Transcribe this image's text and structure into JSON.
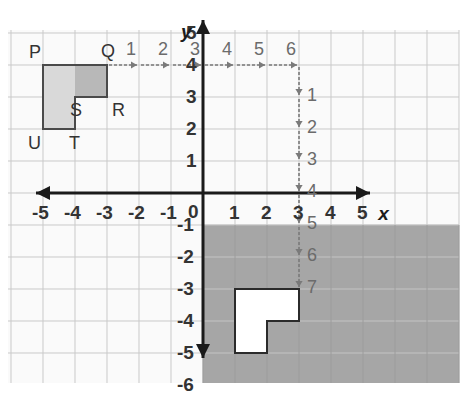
{
  "figure": {
    "type": "coordinate-grid",
    "background_color": "#ffffff",
    "grid_color": "#c9c9c9",
    "grid_minor_color": "#e3e3e3",
    "axis_color": "#1a1a1a",
    "shape_fill": "#d9d9d9",
    "shape_dark_fill": "#b8b8b8",
    "shape_stroke": "#4a4a4a",
    "shaded_region_color": "#a6a6a6",
    "image_fill": "#ffffff",
    "arrow_color": "#7a7a7a"
  },
  "axes": {
    "x_label": "x",
    "y_label": "y",
    "x_ticks": [
      "-5",
      "-4",
      "-3",
      "-2",
      "-1",
      "1",
      "2",
      "3",
      "4",
      "5"
    ],
    "y_ticks": [
      "5",
      "4",
      "3",
      "2",
      "1",
      "-1",
      "-2",
      "-3",
      "-4",
      "-5",
      "-6"
    ],
    "origin_label": "0",
    "x_range": [
      -6,
      6
    ],
    "y_range": [
      -6,
      5
    ],
    "grid_spacing_px": 32
  },
  "preimage": {
    "name": "PQRSTU",
    "vertex_labels": [
      "P",
      "Q",
      "R",
      "S",
      "T",
      "U"
    ],
    "vertices": [
      {
        "label": "P",
        "x": -5,
        "y": 4
      },
      {
        "label": "Q",
        "x": -3,
        "y": 4
      },
      {
        "label": "R",
        "x": -3,
        "y": 3
      },
      {
        "label": "S",
        "x": -4,
        "y": 3
      },
      {
        "label": "T",
        "x": -4,
        "y": 2
      },
      {
        "label": "U",
        "x": -5,
        "y": 2
      }
    ]
  },
  "image_shape": {
    "vertices": [
      {
        "x": 1,
        "y": -3
      },
      {
        "x": 3,
        "y": -3
      },
      {
        "x": 3,
        "y": -4
      },
      {
        "x": 2,
        "y": -4
      },
      {
        "x": 2,
        "y": -5
      },
      {
        "x": 1,
        "y": -5
      }
    ]
  },
  "translation": {
    "horizontal_units": 6,
    "vertical_units": 7,
    "horizontal_counts": [
      "1",
      "2",
      "3",
      "4",
      "5",
      "6"
    ],
    "vertical_counts": [
      "1",
      "2",
      "3",
      "4",
      "5",
      "6",
      "7"
    ],
    "horizontal_start": {
      "x": -3,
      "y": 4
    },
    "vertical_start": {
      "x": 3,
      "y": 4
    },
    "vertical_end": {
      "x": 3,
      "y": -3
    }
  },
  "shaded_region": {
    "description": "Quadrant region right of y-axis and below y = -1",
    "x_start": 0,
    "y_start": -1
  }
}
